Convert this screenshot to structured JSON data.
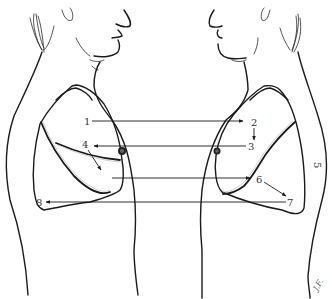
{
  "figure": {
    "views": {
      "left": "Left figure (facing right) with lung outline, oblique fissure and horizontal fissure",
      "right": "Right figure (facing left) with lung outline and oblique fissure"
    }
  },
  "labels": {
    "l1": "1",
    "l2": "2",
    "l3": "3",
    "l4": "4",
    "l5": "5",
    "l6": "6",
    "l7": "7",
    "l8": "8"
  },
  "signature": "J.F.",
  "colors": {
    "line": "#1a1a1a",
    "label": "#333333",
    "background": "#ffffff"
  }
}
